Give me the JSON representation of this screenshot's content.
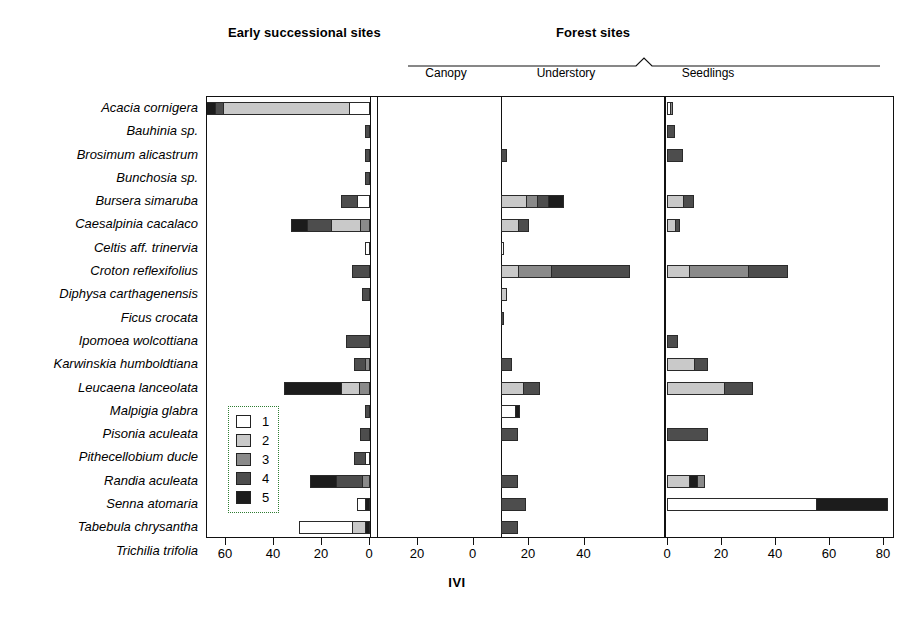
{
  "headers": {
    "early": "Early successional sites",
    "forest": "Forest sites"
  },
  "subheaders": {
    "canopy": "Canopy",
    "understory": "Understory",
    "seedlings": "Seedlings"
  },
  "axis": {
    "title": "IVI",
    "panelA_ticks": [
      60,
      40,
      20,
      0
    ],
    "panelB_ticks": [
      20,
      0,
      20,
      40
    ],
    "panelC_ticks": [
      0,
      20,
      40,
      60,
      80
    ]
  },
  "legend": {
    "entries": [
      {
        "label": "1",
        "color": "#ffffff"
      },
      {
        "label": "2",
        "color": "#c9c9c9"
      },
      {
        "label": "3",
        "color": "#8a8a8a"
      },
      {
        "label": "4",
        "color": "#4d4d4d"
      },
      {
        "label": "5",
        "color": "#1c1c1c"
      }
    ]
  },
  "chart_data": {
    "type": "bar",
    "title": "",
    "xlabel": "IVI",
    "ylabel": "",
    "orientation": "horizontal",
    "stacked": true,
    "grid": false,
    "legend_position": "inside-left",
    "legend_title": "",
    "series": [
      {
        "name": "1",
        "color": "#ffffff"
      },
      {
        "name": "2",
        "color": "#c9c9c9"
      },
      {
        "name": "3",
        "color": "#8a8a8a"
      },
      {
        "name": "4",
        "color": "#4d4d4d"
      },
      {
        "name": "5",
        "color": "#1c1c1c"
      }
    ],
    "panels": [
      {
        "name": "Early successional sites",
        "direction": "left",
        "xmin": 0,
        "xmax": 68
      },
      {
        "name": "Canopy / Understory",
        "direction": "split",
        "xmin": -22,
        "xmax": 50
      },
      {
        "name": "Seedlings",
        "direction": "right",
        "xmin": 0,
        "xmax": 86
      }
    ],
    "categories": [
      "Acacia cornigera",
      "Bauhinia sp.",
      "Brosimum alicastrum",
      "Bunchosia sp.",
      "Bursera simaruba",
      "Caesalpinia cacalaco",
      "Celtis aff. trinervia",
      "Croton reflexifolius",
      "Diphysa carthagenensis",
      "Ficus crocata",
      "Ipomoea wolcottiana",
      "Karwinskia humboldtiana",
      "Leucaena lanceolata",
      "Malpigia glabra",
      "Pisonia aculeata",
      "Pithecellobium ducle",
      "Randia aculeata",
      "Senna atomaria",
      "Tabebula chrysantha",
      "Trichilia trifolia"
    ],
    "rows": [
      {
        "category": "Acacia cornigera",
        "early": [
          {
            "class": "5",
            "value": 6
          },
          {
            "class": "4",
            "value": 3
          },
          {
            "class": "2",
            "value": 48
          },
          {
            "class": "1",
            "value": 8
          }
        ],
        "canopy": [],
        "understory": [],
        "seedlings": [
          {
            "class": "1",
            "value": 1
          },
          {
            "class": "3",
            "value": 1
          }
        ]
      },
      {
        "category": "Bauhinia sp.",
        "early": [
          {
            "class": "4",
            "value": 2
          }
        ],
        "canopy": [],
        "understory": [],
        "seedlings": [
          {
            "class": "4",
            "value": 3
          }
        ]
      },
      {
        "category": "Brosimum alicastrum",
        "early": [
          {
            "class": "4",
            "value": 2
          }
        ],
        "canopy": [
          {
            "class": "4",
            "value": 2
          }
        ],
        "understory": [],
        "seedlings": [
          {
            "class": "4",
            "value": 6
          }
        ]
      },
      {
        "category": "Bunchosia sp.",
        "early": [
          {
            "class": "4",
            "value": 2
          }
        ],
        "canopy": [],
        "understory": [],
        "seedlings": []
      },
      {
        "category": "Bursera simaruba",
        "early": [
          {
            "class": "4",
            "value": 6
          },
          {
            "class": "1",
            "value": 5
          }
        ],
        "canopy": [
          {
            "class": "2",
            "value": 9
          },
          {
            "class": "3",
            "value": 4
          },
          {
            "class": "4",
            "value": 4
          },
          {
            "class": "5",
            "value": 6
          }
        ],
        "understory": [
          {
            "class": "2",
            "value": 10
          },
          {
            "class": "4",
            "value": 3
          }
        ],
        "seedlings": [
          {
            "class": "2",
            "value": 6
          },
          {
            "class": "4",
            "value": 4
          }
        ]
      },
      {
        "category": "Caesalpinia cacalaco",
        "early": [
          {
            "class": "5",
            "value": 6
          },
          {
            "class": "4",
            "value": 9
          },
          {
            "class": "2",
            "value": 11
          },
          {
            "class": "3",
            "value": 4
          }
        ],
        "canopy": [
          {
            "class": "2",
            "value": 6
          },
          {
            "class": "4",
            "value": 4
          }
        ],
        "understory": [],
        "seedlings": [
          {
            "class": "2",
            "value": 3
          },
          {
            "class": "4",
            "value": 2
          }
        ]
      },
      {
        "category": "Celtis aff. trinervia",
        "early": [
          {
            "class": "1",
            "value": 2
          }
        ],
        "canopy": [
          {
            "class": "1",
            "value": 1
          }
        ],
        "understory": [],
        "seedlings": []
      },
      {
        "category": "Croton reflexifolius",
        "early": [
          {
            "class": "4",
            "value": 7
          }
        ],
        "canopy": [
          {
            "class": "2",
            "value": 6
          },
          {
            "class": "3",
            "value": 12
          },
          {
            "class": "4",
            "value": 29
          }
        ],
        "understory": [],
        "seedlings": [
          {
            "class": "2",
            "value": 8
          },
          {
            "class": "3",
            "value": 22
          },
          {
            "class": "4",
            "value": 15
          }
        ]
      },
      {
        "category": "Diphysa carthagenensis",
        "early": [
          {
            "class": "4",
            "value": 3
          }
        ],
        "canopy": [
          {
            "class": "2",
            "value": 2
          }
        ],
        "understory": [],
        "seedlings": []
      },
      {
        "category": "Ficus crocata",
        "early": [],
        "canopy": [
          {
            "class": "4",
            "value": 1
          }
        ],
        "understory": [],
        "seedlings": []
      },
      {
        "category": "Ipomoea wolcottiana",
        "early": [
          {
            "class": "4",
            "value": 9
          }
        ],
        "canopy": [],
        "understory": [],
        "seedlings": [
          {
            "class": "4",
            "value": 4
          }
        ]
      },
      {
        "category": "Karwinskia humboldtiana",
        "early": [
          {
            "class": "4",
            "value": 4
          },
          {
            "class": "3",
            "value": 2
          }
        ],
        "canopy": [
          {
            "class": "4",
            "value": 4
          }
        ],
        "understory": [],
        "seedlings": [
          {
            "class": "2",
            "value": 10
          },
          {
            "class": "4",
            "value": 5
          }
        ]
      },
      {
        "category": "Leucaena lanceolata",
        "early": [
          {
            "class": "5",
            "value": 22
          },
          {
            "class": "2",
            "value": 7
          },
          {
            "class": "3",
            "value": 4
          }
        ],
        "canopy": [
          {
            "class": "2",
            "value": 8
          },
          {
            "class": "4",
            "value": 6
          }
        ],
        "understory": [],
        "seedlings": [
          {
            "class": "2",
            "value": 21
          },
          {
            "class": "4",
            "value": 11
          }
        ]
      },
      {
        "category": "Malpigia glabra",
        "early": [
          {
            "class": "4",
            "value": 2
          }
        ],
        "canopy": [
          {
            "class": "1",
            "value": 5
          },
          {
            "class": "5",
            "value": 2
          }
        ],
        "understory": [],
        "seedlings": []
      },
      {
        "category": "Pisonia aculeata",
        "early": [
          {
            "class": "4",
            "value": 4
          }
        ],
        "canopy": [
          {
            "class": "4",
            "value": 6
          }
        ],
        "understory": [],
        "seedlings": [
          {
            "class": "4",
            "value": 15
          }
        ]
      },
      {
        "category": "Pithecellobium ducle",
        "early": [
          {
            "class": "4",
            "value": 4
          },
          {
            "class": "1",
            "value": 2
          }
        ],
        "canopy": [],
        "understory": [],
        "seedlings": []
      },
      {
        "category": "Randia aculeata",
        "early": [
          {
            "class": "5",
            "value": 10
          },
          {
            "class": "4",
            "value": 10
          },
          {
            "class": "3",
            "value": 3
          }
        ],
        "canopy": [
          {
            "class": "4",
            "value": 6
          }
        ],
        "understory": [],
        "seedlings": [
          {
            "class": "2",
            "value": 8
          },
          {
            "class": "5",
            "value": 3
          },
          {
            "class": "3",
            "value": 3
          }
        ]
      },
      {
        "category": "Senna atomaria",
        "early": [
          {
            "class": "1",
            "value": 3
          },
          {
            "class": "5",
            "value": 2
          }
        ],
        "canopy": [
          {
            "class": "4",
            "value": 9
          }
        ],
        "understory": [],
        "seedlings": [
          {
            "class": "1",
            "value": 55
          },
          {
            "class": "5",
            "value": 27
          }
        ]
      },
      {
        "category": "Tabebula chrysantha",
        "early": [
          {
            "class": "1",
            "value": 20
          },
          {
            "class": "2",
            "value": 5
          },
          {
            "class": "5",
            "value": 2
          }
        ],
        "canopy": [
          {
            "class": "4",
            "value": 6
          }
        ],
        "understory": [],
        "seedlings": []
      },
      {
        "category": "Trichilia trifolia",
        "early": [
          {
            "class": "4",
            "value": 4
          },
          {
            "class": "1",
            "value": 1
          }
        ],
        "canopy": [],
        "understory": [],
        "seedlings": []
      }
    ]
  }
}
